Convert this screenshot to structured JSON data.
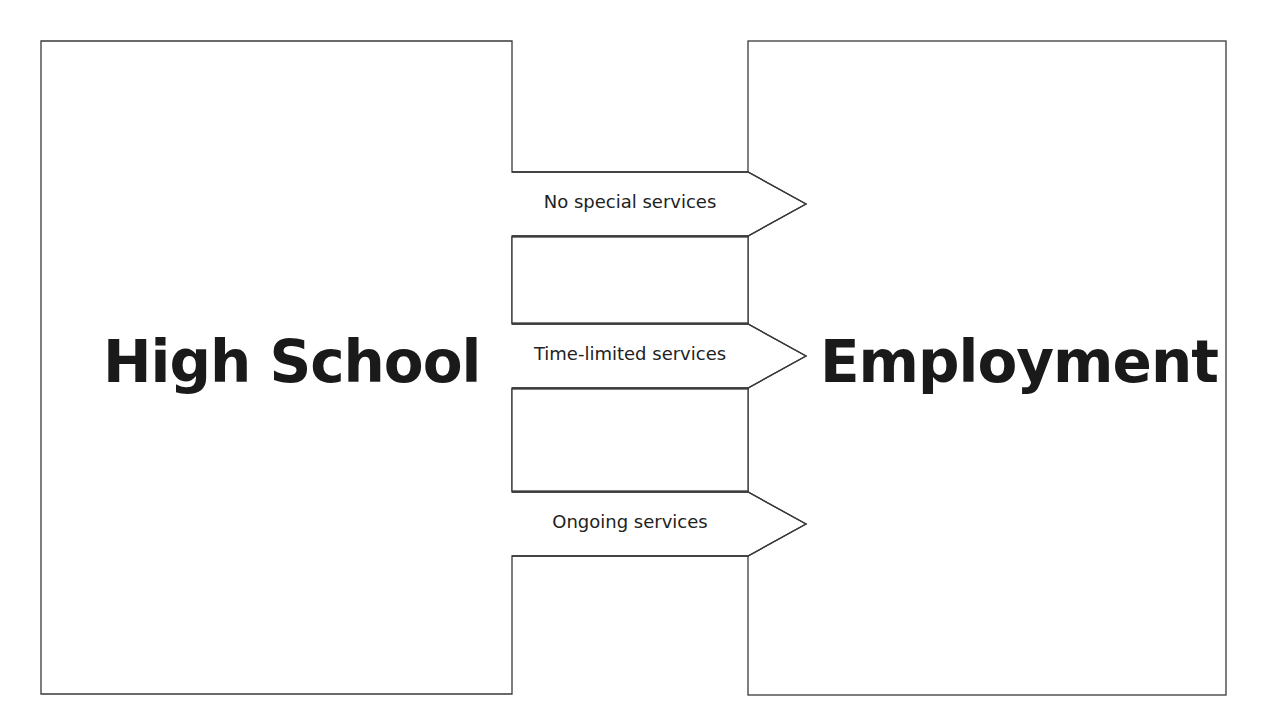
{
  "diagram": {
    "left_box": {
      "label": "High School"
    },
    "right_box": {
      "label": "Employment"
    },
    "pathways": [
      {
        "label": "No special services"
      },
      {
        "label": "Time-limited services"
      },
      {
        "label": "Ongoing services"
      }
    ],
    "colors": {
      "stroke": "#3a3a3a",
      "text": "#1a1a1a",
      "background": "#ffffff"
    }
  }
}
